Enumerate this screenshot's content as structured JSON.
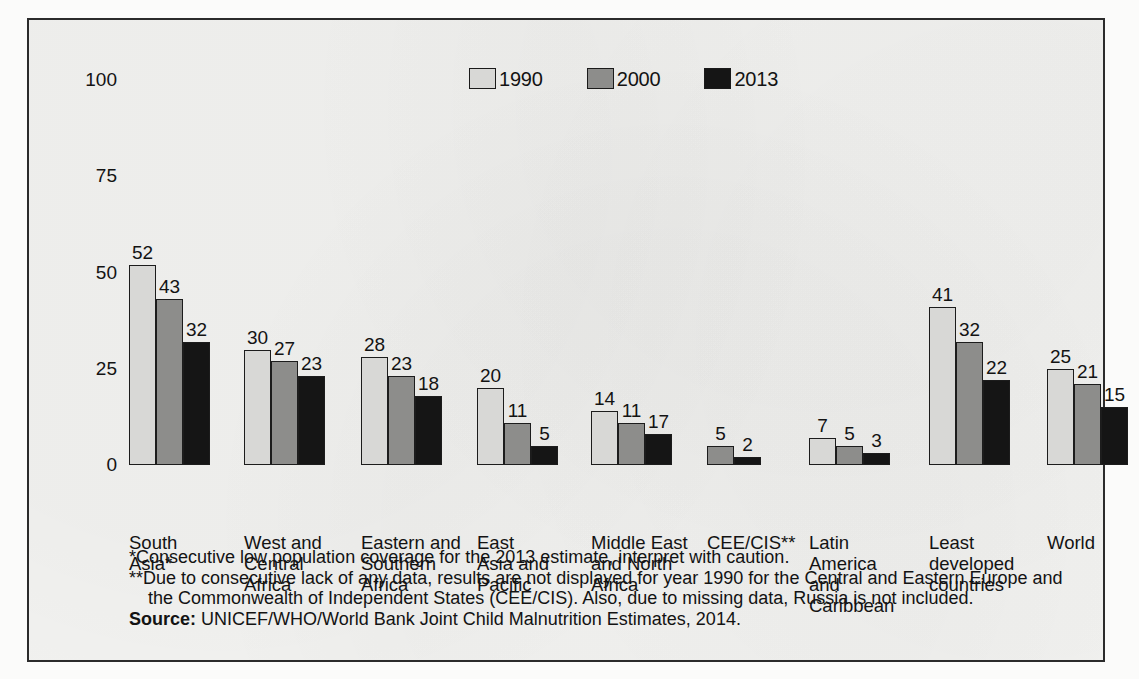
{
  "chart_data": {
    "type": "bar",
    "title": "",
    "xlabel": "",
    "ylabel": "",
    "ylim": [
      0,
      100
    ],
    "yticks": [
      "0",
      "25",
      "50",
      "75",
      "100"
    ],
    "grid": false,
    "legend_position": "top-center",
    "categories": [
      "South\nAsia*",
      "West and\nCentral\nAfrica",
      "Eastern and\nSouthern\nAfrica",
      "East\nAsia and\nPacific",
      "Middle East\nand North\nAfrica",
      "CEE/CIS**",
      "Latin\nAmerica\nand\nCaribbean",
      "Least\ndeveloped\ncountries",
      "World"
    ],
    "series": [
      {
        "name": "1990",
        "color": "#d8d8d6",
        "values": [
          52,
          30,
          28,
          20,
          14,
          null,
          7,
          41,
          25
        ]
      },
      {
        "name": "2000",
        "color": "#8d8d8b",
        "values": [
          43,
          27,
          23,
          11,
          11,
          5,
          5,
          32,
          21
        ]
      },
      {
        "name": "2013",
        "color": "#151515",
        "values": [
          32,
          23,
          18,
          5,
          17,
          2,
          3,
          22,
          15
        ]
      }
    ],
    "bar_heights": {
      "note": "drawn pixel heights where they differ from the printed label",
      "1990": [
        52,
        30,
        28,
        20,
        14,
        null,
        7,
        41,
        25
      ],
      "2000": [
        43,
        27,
        23,
        11,
        11,
        5,
        5,
        32,
        21
      ],
      "2013": [
        32,
        23,
        18,
        5,
        8,
        2,
        3,
        22,
        15
      ]
    }
  },
  "legend": {
    "items": [
      {
        "label": "1990"
      },
      {
        "label": "2000"
      },
      {
        "label": "2013"
      }
    ]
  },
  "notes": {
    "note1": "*Consecutive low population coverage for the 2013 estimate, interpret with caution.",
    "note2": "**Due to consecutive lack of any data, results are not displayed for year 1990 for the Central and Eastern Europe and the Commonwealth of Independent States (CEE/CIS). Also, due to missing data, Russia is not included.",
    "source_label": "Source:",
    "source_text": "UNICEF/WHO/World Bank Joint Child Malnutrition Estimates, 2014."
  }
}
